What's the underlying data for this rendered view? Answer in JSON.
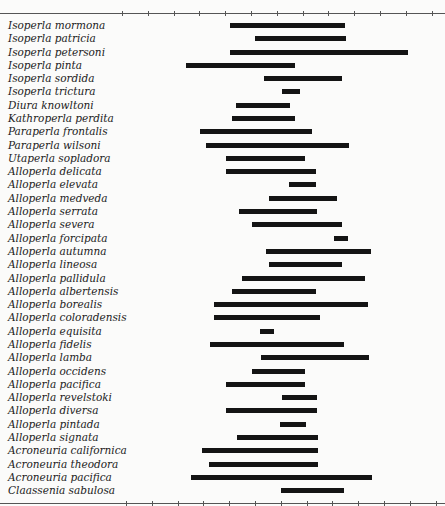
{
  "chart_data": {
    "type": "range-bar",
    "title": "",
    "xlabel": "",
    "ylabel": "",
    "x_scale": "tick index (13 unlabeled ticks, 0-12)",
    "xlim": [
      0,
      12
    ],
    "grid": false,
    "legend": null,
    "categories": [
      "Isoperla mormona",
      "Isoperla patricia",
      "Isoperla petersoni",
      "Isoperla pinta",
      "Isoperla sordida",
      "Isoperla trictura",
      "Diura knowltoni",
      "Kathroperla perdita",
      "Paraperla frontalis",
      "Paraperla wilsoni",
      "Utaperla sopladora",
      "Alloperla delicata",
      "Alloperla elevata",
      "Alloperla medveda",
      "Alloperla serrata",
      "Alloperla severa",
      "Alloperla forcipata",
      "Alloperla autumna",
      "Alloperla lineosa",
      "Alloperla pallidula",
      "Alloperla albertensis",
      "Alloperla borealis",
      "Alloperla coloradensis",
      "Alloperla equisita",
      "Alloperla fidelis",
      "Alloperla lamba",
      "Alloperla occidens",
      "Alloperla pacifica",
      "Alloperla revelstoki",
      "Alloperla diversa",
      "Alloperla pintada",
      "Alloperla signata",
      "Acroneuria californica",
      "Acroneuria theodora",
      "Acroneuria pacifica",
      "Claassenia sabulosa"
    ],
    "ranges": [
      [
        4.19,
        8.64
      ],
      [
        5.16,
        8.68
      ],
      [
        4.19,
        11.09
      ],
      [
        2.48,
        6.71
      ],
      [
        5.5,
        8.53
      ],
      [
        6.2,
        6.9
      ],
      [
        4.42,
        6.51
      ],
      [
        4.26,
        6.71
      ],
      [
        3.02,
        7.36
      ],
      [
        3.26,
        8.8
      ],
      [
        4.03,
        7.09
      ],
      [
        4.03,
        7.52
      ],
      [
        6.47,
        7.52
      ],
      [
        5.7,
        8.33
      ],
      [
        4.53,
        7.56
      ],
      [
        5.04,
        8.53
      ],
      [
        8.22,
        8.76
      ],
      [
        5.58,
        9.65
      ],
      [
        5.7,
        8.53
      ],
      [
        4.65,
        9.42
      ],
      [
        4.26,
        7.52
      ],
      [
        3.57,
        9.53
      ],
      [
        3.57,
        7.67
      ],
      [
        5.35,
        5.89
      ],
      [
        3.41,
        8.6
      ],
      [
        5.39,
        9.57
      ],
      [
        5.04,
        7.09
      ],
      [
        4.03,
        7.09
      ],
      [
        6.2,
        7.56
      ],
      [
        4.03,
        7.56
      ],
      [
        6.12,
        7.13
      ],
      [
        4.46,
        7.6
      ],
      [
        3.1,
        7.6
      ],
      [
        3.37,
        7.6
      ],
      [
        2.67,
        9.69
      ],
      [
        6.16,
        8.6
      ]
    ],
    "tick_count": 13
  },
  "layout": {
    "tick0_x": 122,
    "tick_spacing": 25.8,
    "row0_y": 23,
    "row_step": 13.29,
    "top_axis_y": 13,
    "bottom_axis_y": 503,
    "bottom_tick_offset": 4
  }
}
